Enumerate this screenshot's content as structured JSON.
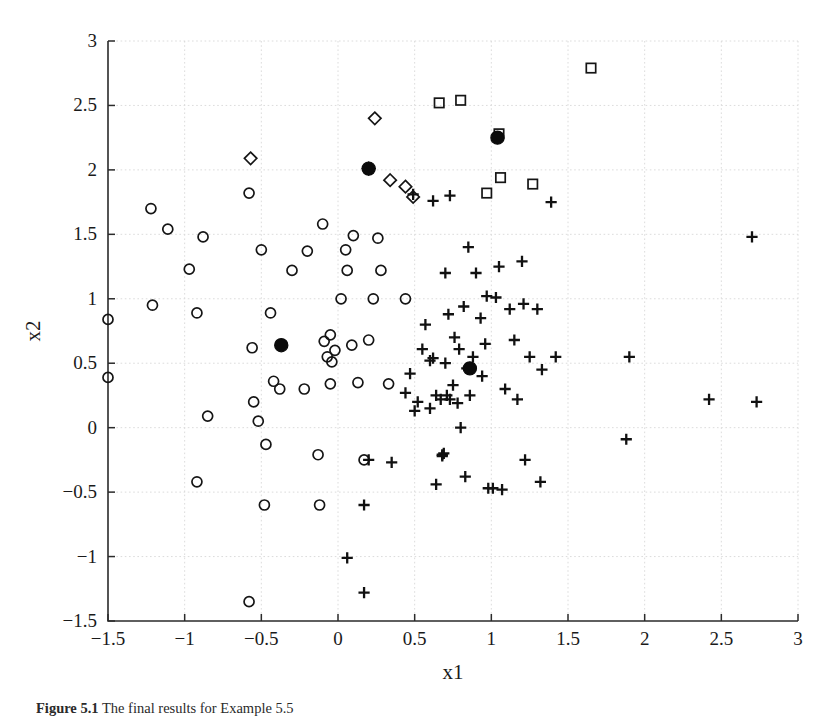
{
  "figure": {
    "caption_label": "Figure 5.1",
    "caption_text": "The final results for Example 5.5"
  },
  "chart_data": {
    "type": "scatter",
    "title": "",
    "xlabel": "x1",
    "ylabel": "x2",
    "xlim": [
      -1.5,
      3
    ],
    "ylim": [
      -1.5,
      3
    ],
    "xticks": [
      -1.5,
      -1,
      -0.5,
      0,
      0.5,
      1,
      1.5,
      2,
      2.5,
      3
    ],
    "yticks": [
      -1.5,
      -1,
      -0.5,
      0,
      0.5,
      1,
      1.5,
      2,
      2.5,
      3
    ],
    "xtick_labels": [
      "-1.5",
      "-1",
      "-0.5",
      "0",
      "0.5",
      "1",
      "1.5",
      "2",
      "2.5",
      "3"
    ],
    "ytick_labels": [
      "-1.5",
      "-1",
      "-0.5",
      "0",
      "0.5",
      "1",
      "1.5",
      "2",
      "2.5",
      "3"
    ],
    "grid": true,
    "legend": "none",
    "series": [
      {
        "name": "cluster-circles",
        "marker": "circle",
        "filled": false,
        "points": [
          [
            -1.5,
            0.84
          ],
          [
            -1.5,
            0.39
          ],
          [
            -1.22,
            1.7
          ],
          [
            -1.21,
            0.95
          ],
          [
            -1.11,
            1.54
          ],
          [
            -0.97,
            1.23
          ],
          [
            -0.92,
            0.89
          ],
          [
            -0.92,
            -0.42
          ],
          [
            -0.88,
            1.48
          ],
          [
            -0.85,
            0.09
          ],
          [
            -0.58,
            1.82
          ],
          [
            -0.58,
            -1.35
          ],
          [
            -0.56,
            0.62
          ],
          [
            -0.55,
            0.2
          ],
          [
            -0.52,
            0.05
          ],
          [
            -0.5,
            1.38
          ],
          [
            -0.48,
            -0.6
          ],
          [
            -0.47,
            -0.13
          ],
          [
            -0.44,
            0.89
          ],
          [
            -0.42,
            0.36
          ],
          [
            -0.38,
            0.3
          ],
          [
            -0.3,
            1.22
          ],
          [
            -0.22,
            0.3
          ],
          [
            -0.2,
            1.37
          ],
          [
            -0.13,
            -0.21
          ],
          [
            -0.12,
            -0.6
          ],
          [
            -0.1,
            1.58
          ],
          [
            -0.09,
            0.67
          ],
          [
            -0.07,
            0.55
          ],
          [
            -0.05,
            0.72
          ],
          [
            -0.04,
            0.51
          ],
          [
            -0.02,
            0.6
          ],
          [
            0.02,
            1.0
          ],
          [
            0.05,
            1.38
          ],
          [
            0.06,
            1.22
          ],
          [
            0.09,
            0.64
          ],
          [
            0.1,
            1.49
          ],
          [
            0.13,
            0.35
          ],
          [
            0.17,
            -0.25
          ],
          [
            0.2,
            0.68
          ],
          [
            0.23,
            1.0
          ],
          [
            0.26,
            1.47
          ],
          [
            0.28,
            1.22
          ],
          [
            0.33,
            0.34
          ],
          [
            0.44,
            1.0
          ],
          [
            -0.05,
            0.34
          ]
        ]
      },
      {
        "name": "cluster-plus",
        "marker": "plus",
        "filled": true,
        "points": [
          [
            0.06,
            -1.01
          ],
          [
            0.17,
            -1.28
          ],
          [
            0.17,
            -0.6
          ],
          [
            0.2,
            -0.25
          ],
          [
            0.35,
            -0.27
          ],
          [
            0.44,
            0.27
          ],
          [
            0.47,
            0.42
          ],
          [
            0.49,
            1.81
          ],
          [
            0.5,
            0.13
          ],
          [
            0.52,
            0.2
          ],
          [
            0.55,
            0.61
          ],
          [
            0.57,
            0.8
          ],
          [
            0.6,
            0.52
          ],
          [
            0.6,
            0.15
          ],
          [
            0.62,
            0.54
          ],
          [
            0.62,
            1.76
          ],
          [
            0.64,
            0.25
          ],
          [
            0.64,
            -0.44
          ],
          [
            0.67,
            0.22
          ],
          [
            0.68,
            -0.21
          ],
          [
            0.69,
            -0.2
          ],
          [
            0.7,
            0.5
          ],
          [
            0.7,
            1.2
          ],
          [
            0.71,
            0.25
          ],
          [
            0.72,
            0.88
          ],
          [
            0.73,
            0.22
          ],
          [
            0.73,
            1.8
          ],
          [
            0.75,
            0.33
          ],
          [
            0.76,
            0.7
          ],
          [
            0.78,
            0.19
          ],
          [
            0.79,
            0.61
          ],
          [
            0.8,
            0.0
          ],
          [
            0.82,
            0.94
          ],
          [
            0.83,
            -0.38
          ],
          [
            0.85,
            1.4
          ],
          [
            0.86,
            0.25
          ],
          [
            0.88,
            0.55
          ],
          [
            0.9,
            1.2
          ],
          [
            0.93,
            0.85
          ],
          [
            0.94,
            0.4
          ],
          [
            0.96,
            0.65
          ],
          [
            0.97,
            1.02
          ],
          [
            0.98,
            -0.47
          ],
          [
            1.01,
            -0.47
          ],
          [
            1.03,
            1.01
          ],
          [
            1.05,
            1.25
          ],
          [
            1.07,
            -0.48
          ],
          [
            1.09,
            0.3
          ],
          [
            1.12,
            0.92
          ],
          [
            1.15,
            0.68
          ],
          [
            1.17,
            0.22
          ],
          [
            1.2,
            1.29
          ],
          [
            1.21,
            0.96
          ],
          [
            1.22,
            -0.25
          ],
          [
            1.25,
            0.55
          ],
          [
            1.3,
            0.92
          ],
          [
            1.32,
            -0.42
          ],
          [
            1.33,
            0.45
          ],
          [
            1.39,
            1.75
          ],
          [
            1.42,
            0.55
          ],
          [
            1.88,
            -0.09
          ],
          [
            1.9,
            0.55
          ],
          [
            2.42,
            0.22
          ],
          [
            2.7,
            1.48
          ],
          [
            2.73,
            0.2
          ],
          [
            0.68,
            -0.22
          ],
          [
            0.84,
            0.46
          ]
        ]
      },
      {
        "name": "cluster-diamonds",
        "marker": "diamond",
        "filled": false,
        "points": [
          [
            -0.57,
            2.09
          ],
          [
            0.24,
            2.4
          ],
          [
            0.34,
            1.92
          ],
          [
            0.44,
            1.87
          ],
          [
            0.49,
            1.79
          ],
          [
            0.2,
            2.01
          ]
        ]
      },
      {
        "name": "cluster-squares",
        "marker": "square",
        "filled": false,
        "points": [
          [
            0.66,
            2.52
          ],
          [
            0.8,
            2.54
          ],
          [
            1.05,
            2.28
          ],
          [
            1.06,
            1.94
          ],
          [
            1.27,
            1.89
          ],
          [
            0.97,
            1.82
          ],
          [
            1.65,
            2.79
          ]
        ]
      },
      {
        "name": "centroids",
        "marker": "filled-circle",
        "filled": true,
        "points": [
          [
            -0.37,
            0.64
          ],
          [
            0.2,
            2.01
          ],
          [
            1.04,
            2.25
          ],
          [
            0.86,
            0.46
          ]
        ]
      }
    ]
  }
}
